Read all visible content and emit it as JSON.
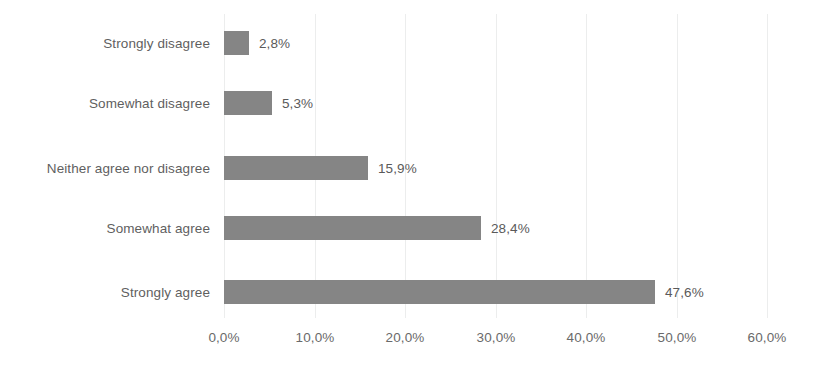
{
  "chart_data": {
    "type": "bar",
    "orientation": "horizontal",
    "title": "",
    "subtitle": "",
    "xlabel": "",
    "ylabel": "",
    "categories": [
      "Strongly disagree",
      "Somewhat disagree",
      "Neither agree nor disagree",
      "Somewhat agree",
      "Strongly agree"
    ],
    "values": [
      2.8,
      5.3,
      15.9,
      28.4,
      47.6
    ],
    "value_labels": [
      "2,8%",
      "5,3%",
      "15,9%",
      "28,4%",
      "47,6%"
    ],
    "xlim": [
      0,
      60
    ],
    "xticks": [
      0,
      10,
      20,
      30,
      40,
      50,
      60
    ],
    "xtick_labels": [
      "0,0%",
      "10,0%",
      "20,0%",
      "30,0%",
      "40,0%",
      "50,0%",
      "60,0%"
    ],
    "grid": true,
    "legend": false,
    "bar_color": "#858585",
    "label_color": "#5f5f5f",
    "gridline_color": "#eceded",
    "background_color": "#ffffff"
  }
}
